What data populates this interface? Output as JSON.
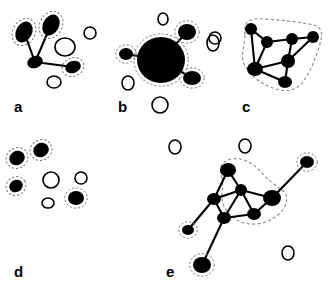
{
  "figure": {
    "background_color": "#ffffff",
    "node_fill_color": "#000000",
    "open_node_stroke_color": "#000000",
    "edge_color": "#000000",
    "halo_color": "#777777",
    "boundary_color": "#888888",
    "panel_count": 5
  },
  "panels": [
    {
      "id": "a",
      "label": "a",
      "label_x": 14,
      "label_y": 112,
      "has_cluster_boundary": false,
      "filled_nodes": [
        {
          "id": "a1",
          "cx": 24,
          "cy": 32,
          "rx": 11,
          "ry": 8,
          "rot": -62,
          "halo": true
        },
        {
          "id": "a2",
          "cx": 51,
          "cy": 25,
          "rx": 11,
          "ry": 8,
          "rot": -62,
          "halo": true
        },
        {
          "id": "a3",
          "cx": 35,
          "cy": 62,
          "rx": 8,
          "ry": 6,
          "rot": -20,
          "halo": false
        },
        {
          "id": "a4",
          "cx": 73,
          "cy": 67,
          "rx": 8,
          "ry": 6,
          "rot": -20,
          "halo": true
        }
      ],
      "open_nodes": [
        {
          "id": "ao1",
          "cx": 65,
          "cy": 47,
          "rx": 10,
          "ry": 9
        },
        {
          "id": "ao2",
          "cx": 90,
          "cy": 33,
          "rx": 6,
          "ry": 6
        },
        {
          "id": "ao3",
          "cx": 54,
          "cy": 82,
          "rx": 7,
          "ry": 6
        }
      ],
      "edges": [
        {
          "from": "a1",
          "to": "a3"
        },
        {
          "from": "a2",
          "to": "a3"
        },
        {
          "from": "a3",
          "to": "a4"
        }
      ]
    },
    {
      "id": "b",
      "label": "b",
      "label_x": 118,
      "label_y": 112,
      "has_cluster_boundary": false,
      "filled_nodes": [
        {
          "id": "b_hub",
          "cx": 161,
          "cy": 60,
          "rx": 24,
          "ry": 23,
          "rot": 0,
          "halo": true
        },
        {
          "id": "b2",
          "cx": 126,
          "cy": 54,
          "rx": 7,
          "ry": 6,
          "rot": 0,
          "halo": true
        },
        {
          "id": "b3",
          "cx": 187,
          "cy": 32,
          "rx": 9,
          "ry": 8,
          "rot": 0,
          "halo": true
        },
        {
          "id": "b4",
          "cx": 192,
          "cy": 78,
          "rx": 9,
          "ry": 7,
          "rot": 0,
          "halo": true
        }
      ],
      "open_nodes": [
        {
          "id": "bo1",
          "cx": 163,
          "cy": 19,
          "rx": 5,
          "ry": 6
        },
        {
          "id": "bo2",
          "cx": 215,
          "cy": 38,
          "rx": 6,
          "ry": 6
        },
        {
          "id": "bo3",
          "cx": 128,
          "cy": 83,
          "rx": 6,
          "ry": 7
        },
        {
          "id": "bo4",
          "cx": 160,
          "cy": 105,
          "rx": 8,
          "ry": 8
        }
      ],
      "edges": [
        {
          "from": "b_hub",
          "to": "b2"
        },
        {
          "from": "b_hub",
          "to": "b3"
        },
        {
          "from": "b_hub",
          "to": "b4"
        }
      ]
    },
    {
      "id": "c",
      "label": "c",
      "label_x": 242,
      "label_y": 112,
      "has_cluster_boundary": true,
      "boundary_path": "M 245,35 C 243,20 250,18 264,19 C 282,20 300,22 314,25 C 322,27 323,34 320,44 C 316,58 310,72 303,82 C 296,91 286,92 276,89 C 262,85 250,76 244,64 C 240,55 245,44 245,35 Z",
      "filled_nodes": [
        {
          "id": "c1",
          "cx": 251,
          "cy": 29,
          "rx": 6,
          "ry": 6,
          "rot": 0,
          "halo": false
        },
        {
          "id": "c2",
          "cx": 267,
          "cy": 42,
          "rx": 6,
          "ry": 6,
          "rot": 0,
          "halo": false
        },
        {
          "id": "c3",
          "cx": 292,
          "cy": 39,
          "rx": 6,
          "ry": 6,
          "rot": 0,
          "halo": false
        },
        {
          "id": "c4",
          "cx": 313,
          "cy": 37,
          "rx": 6,
          "ry": 6,
          "rot": 0,
          "halo": false
        },
        {
          "id": "c5",
          "cx": 288,
          "cy": 61,
          "rx": 7,
          "ry": 7,
          "rot": 0,
          "halo": false
        },
        {
          "id": "c6",
          "cx": 255,
          "cy": 69,
          "rx": 8,
          "ry": 7,
          "rot": 0,
          "halo": false
        },
        {
          "id": "c7",
          "cx": 285,
          "cy": 82,
          "rx": 7,
          "ry": 6,
          "rot": 0,
          "halo": false
        }
      ],
      "open_nodes": [
        {
          "id": "co1",
          "cx": 213,
          "cy": 43,
          "rx": 6,
          "ry": 8
        }
      ],
      "edges": [
        {
          "from": "c1",
          "to": "c2"
        },
        {
          "from": "c1",
          "to": "c6"
        },
        {
          "from": "c2",
          "to": "c3"
        },
        {
          "from": "c2",
          "to": "c6"
        },
        {
          "from": "c3",
          "to": "c4"
        },
        {
          "from": "c3",
          "to": "c5"
        },
        {
          "from": "c4",
          "to": "c5"
        },
        {
          "from": "c5",
          "to": "c6"
        },
        {
          "from": "c5",
          "to": "c7"
        },
        {
          "from": "c6",
          "to": "c7"
        }
      ]
    },
    {
      "id": "d",
      "label": "d",
      "label_x": 14,
      "label_y": 277,
      "has_cluster_boundary": false,
      "filled_nodes": [
        {
          "id": "d1",
          "cx": 17,
          "cy": 158,
          "rx": 8,
          "ry": 7,
          "rot": -30,
          "halo": true
        },
        {
          "id": "d2",
          "cx": 41,
          "cy": 150,
          "rx": 8,
          "ry": 7,
          "rot": -30,
          "halo": true
        },
        {
          "id": "d3",
          "cx": 16,
          "cy": 186,
          "rx": 7,
          "ry": 6,
          "rot": -30,
          "halo": true
        },
        {
          "id": "d4",
          "cx": 76,
          "cy": 198,
          "rx": 8,
          "ry": 7,
          "rot": 0,
          "halo": true
        }
      ],
      "open_nodes": [
        {
          "id": "do1",
          "cx": 51,
          "cy": 180,
          "rx": 8,
          "ry": 8
        },
        {
          "id": "do2",
          "cx": 81,
          "cy": 178,
          "rx": 6,
          "ry": 6
        },
        {
          "id": "do3",
          "cx": 48,
          "cy": 203,
          "rx": 6,
          "ry": 5
        }
      ],
      "edges": []
    },
    {
      "id": "e",
      "label": "e",
      "label_x": 166,
      "label_y": 277,
      "has_cluster_boundary": true,
      "boundary_path": "M 222,178 C 218,168 222,161 231,159 C 243,157 253,163 261,172 C 268,180 276,186 282,190 C 289,195 288,204 281,212 C 274,220 262,225 250,224 C 238,223 229,216 224,206 C 220,197 224,187 222,178 Z",
      "filled_nodes": [
        {
          "id": "e1",
          "cx": 228,
          "cy": 170,
          "rx": 8,
          "ry": 7,
          "rot": 0,
          "halo": false
        },
        {
          "id": "e2",
          "cx": 241,
          "cy": 190,
          "rx": 6,
          "ry": 6,
          "rot": 0,
          "halo": false
        },
        {
          "id": "e3",
          "cx": 214,
          "cy": 199,
          "rx": 7,
          "ry": 6,
          "rot": 0,
          "halo": false
        },
        {
          "id": "e4",
          "cx": 272,
          "cy": 198,
          "rx": 9,
          "ry": 8,
          "rot": 0,
          "halo": false
        },
        {
          "id": "e5",
          "cx": 224,
          "cy": 218,
          "rx": 7,
          "ry": 6,
          "rot": 0,
          "halo": false
        },
        {
          "id": "e6",
          "cx": 254,
          "cy": 214,
          "rx": 7,
          "ry": 6,
          "rot": 0,
          "halo": false
        },
        {
          "id": "e7",
          "cx": 188,
          "cy": 230,
          "rx": 6,
          "ry": 5,
          "rot": 0,
          "halo": true
        },
        {
          "id": "e8",
          "cx": 307,
          "cy": 162,
          "rx": 7,
          "ry": 6,
          "rot": 0,
          "halo": true
        },
        {
          "id": "e9",
          "cx": 202,
          "cy": 265,
          "rx": 9,
          "ry": 8,
          "rot": 0,
          "halo": true
        }
      ],
      "open_nodes": [
        {
          "id": "eo1",
          "cx": 175,
          "cy": 147,
          "rx": 6,
          "ry": 7
        },
        {
          "id": "eo2",
          "cx": 245,
          "cy": 146,
          "rx": 6,
          "ry": 7
        },
        {
          "id": "eo3",
          "cx": 288,
          "cy": 253,
          "rx": 6,
          "ry": 7
        }
      ],
      "edges": [
        {
          "from": "e1",
          "to": "e2"
        },
        {
          "from": "e1",
          "to": "e3"
        },
        {
          "from": "e2",
          "to": "e3"
        },
        {
          "from": "e2",
          "to": "e4"
        },
        {
          "from": "e2",
          "to": "e5"
        },
        {
          "from": "e2",
          "to": "e6"
        },
        {
          "from": "e3",
          "to": "e5"
        },
        {
          "from": "e3",
          "to": "e7"
        },
        {
          "from": "e4",
          "to": "e6"
        },
        {
          "from": "e4",
          "to": "e8"
        },
        {
          "from": "e5",
          "to": "e6"
        },
        {
          "from": "e5",
          "to": "e9"
        }
      ]
    }
  ]
}
